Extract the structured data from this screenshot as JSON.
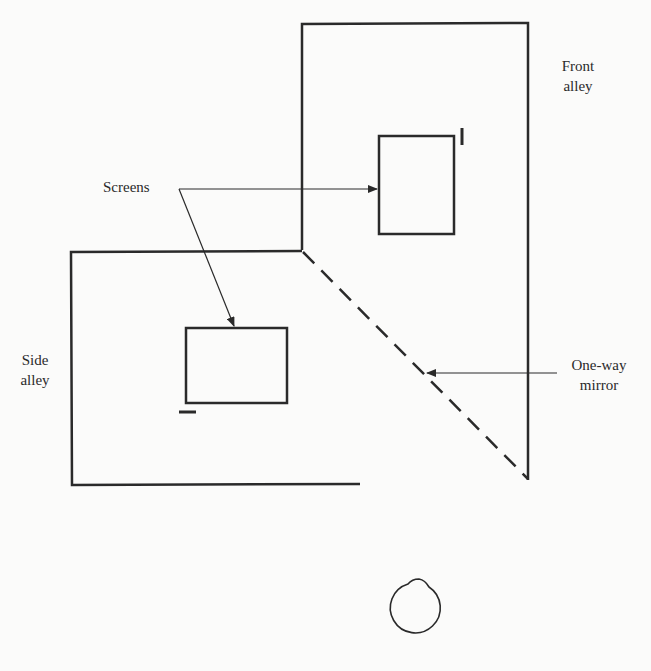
{
  "labels": {
    "screens": "Screens",
    "front_alley_1": "Front",
    "front_alley_2": "alley",
    "side_alley_1": "Side",
    "side_alley_2": "alley",
    "mirror_1": "One-way",
    "mirror_2": "mirror"
  },
  "colors": {
    "stroke": "#2a2a2a",
    "background": "#fbfbfa"
  }
}
